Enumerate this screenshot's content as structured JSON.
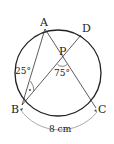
{
  "diagram": {
    "type": "circle-geometry",
    "points": {
      "A": {
        "label": "A",
        "x": 45,
        "y": 29
      },
      "B": {
        "label": "B",
        "x": 22,
        "y": 105
      },
      "C": {
        "label": "C",
        "x": 96,
        "y": 108
      },
      "D": {
        "label": "D",
        "x": 81,
        "y": 35
      },
      "P": {
        "label": "P",
        "x": 63,
        "y": 58
      }
    },
    "segments": [
      "AB",
      "AC",
      "BD"
    ],
    "angles": {
      "ABD": {
        "label": "25°"
      },
      "BPC": {
        "label": "75°"
      }
    },
    "arc_length": {
      "label": "8 cm",
      "arc": "BC"
    },
    "colors": {
      "stroke": "#222222",
      "background": "#ffffff"
    }
  }
}
